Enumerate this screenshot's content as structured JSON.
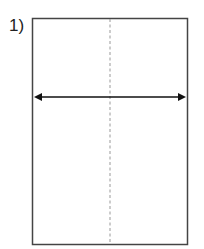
{
  "diagram": {
    "step_label": "1)",
    "shape": "rectangle",
    "guide": "dashed-vertical-center-line",
    "arrow": "double-headed-horizontal-arrow",
    "colors": {
      "stroke": "#333333",
      "dashed": "#888888",
      "arrow": "#111111"
    }
  }
}
